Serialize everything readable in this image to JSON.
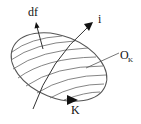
{
  "diagram": {
    "labels": {
      "df": "df",
      "i": "i",
      "o_main": "O",
      "o_sub": "K",
      "k": "K"
    },
    "colors": {
      "stroke": "#555555",
      "arrow": "#111111",
      "text": "#111111",
      "background": "#ffffff"
    }
  }
}
